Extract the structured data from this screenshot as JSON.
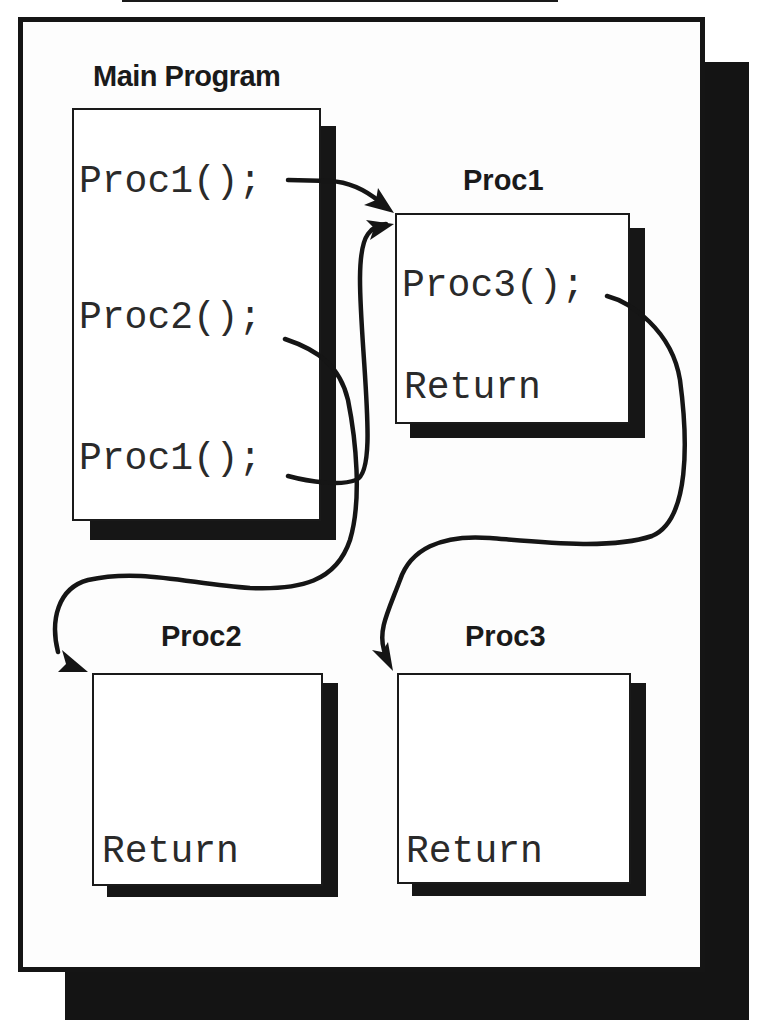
{
  "diagram": {
    "main": {
      "title": "Main Program",
      "lines": [
        "Proc1();",
        "Proc2();",
        "Proc1();"
      ]
    },
    "proc1": {
      "title": "Proc1",
      "lines": [
        "Proc3();",
        "Return"
      ]
    },
    "proc2": {
      "title": "Proc2",
      "lines": [
        "Return"
      ]
    },
    "proc3": {
      "title": "Proc3",
      "lines": [
        "Return"
      ]
    },
    "calls": [
      {
        "from": "Main Program: Proc1();",
        "to": "Proc1"
      },
      {
        "from": "Main Program: Proc2();",
        "to": "Proc2"
      },
      {
        "from": "Main Program: Proc1(); (second)",
        "to": "Proc1"
      },
      {
        "from": "Proc1: Proc3();",
        "to": "Proc3"
      }
    ],
    "colors": {
      "ink": "#151515",
      "paper": "#ffffff"
    }
  }
}
